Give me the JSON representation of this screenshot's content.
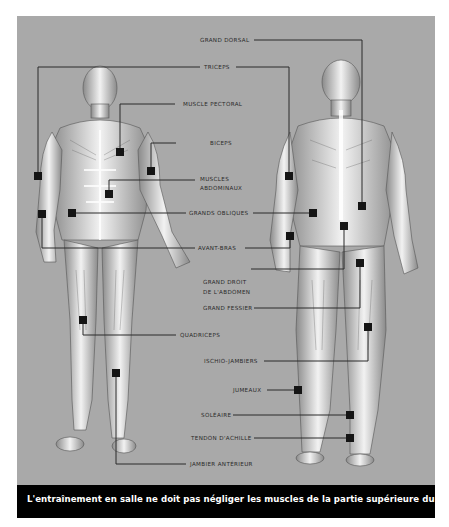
{
  "figure": {
    "caption": "L'entraînement en salle ne doit pas négliger les muscles de la partie supérieure du corps.",
    "colors": {
      "background": "#a9a9a9",
      "caption_bar": "#000000",
      "caption_text": "#ffffff",
      "leader": "#2a2a2a",
      "marker": "#151515"
    },
    "figures": [
      "front-view",
      "back-view"
    ],
    "labels": {
      "grand_dorsal": "GRAND DORSAL",
      "triceps": "TRICEPS",
      "muscle_pectoral": "MUSCLE PECTORAL",
      "biceps": "BICEPS",
      "muscles_abdominaux_1": "MUSCLES",
      "muscles_abdominaux_2": "ABDOMINAUX",
      "grands_obliques": "GRANDS OBLIQUES",
      "avant_bras": "AVANT-BRAS",
      "grand_droit_1": "GRAND DROIT",
      "grand_droit_2": "DE L'ABDOMEN",
      "grand_fessier": "GRAND FESSIER",
      "quadriceps": "QUADRICEPS",
      "ischio_jambiers": "ISCHIO-JAMBIERS",
      "jumeaux": "JUMEAUX",
      "soleaire": "SOLÉAIRE",
      "tendon_achille": "TENDON D'ACHILLE",
      "jambier_anterieur": "JAMBIER ANTÉRIEUR"
    }
  }
}
